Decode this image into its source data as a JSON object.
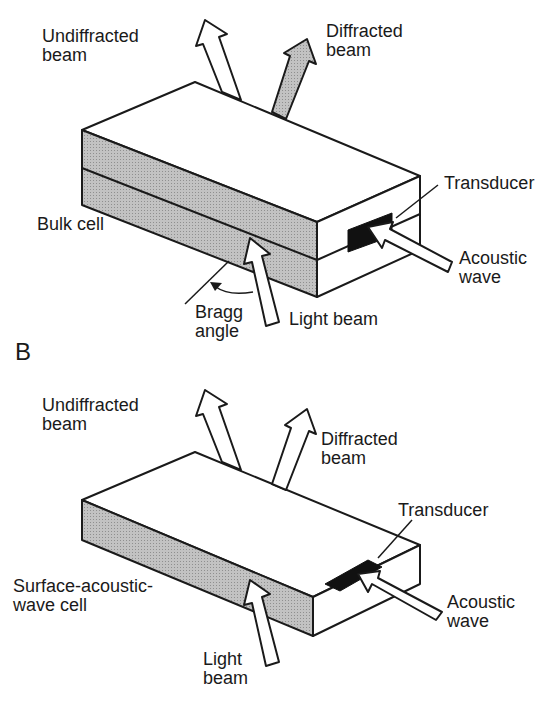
{
  "panel_a": {
    "undiffracted_line1": "Undiffracted",
    "undiffracted_line2": "beam",
    "diffracted_line1": "Diffracted",
    "diffracted_line2": "beam",
    "transducer": "Transducer",
    "bulk_cell": "Bulk cell",
    "acoustic_line1": "Acoustic",
    "acoustic_line2": "wave",
    "bragg_line1": "Bragg",
    "bragg_line2": "angle",
    "light_beam": "Light beam"
  },
  "panel_b": {
    "section_label": "B",
    "undiffracted_line1": "Undiffracted",
    "undiffracted_line2": "beam",
    "diffracted_line1": "Diffracted",
    "diffracted_line2": "beam",
    "transducer": "Transducer",
    "saw_line1": "Surface-acoustic-",
    "saw_line2": "wave cell",
    "acoustic_line1": "Acoustic",
    "acoustic_line2": "wave",
    "light_line1": "Light",
    "light_line2": "beam"
  },
  "colors": {
    "stroke": "#1a1a1a",
    "side_fill": "#b4b4b4",
    "diffracted_fill": "#c4c4c4",
    "transducer_fill": "#111111"
  }
}
